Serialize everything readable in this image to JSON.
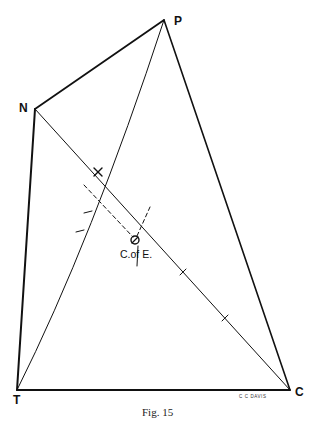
{
  "figure": {
    "caption": "Fig. 15",
    "signature": "C C DAVIS",
    "points": {
      "P": {
        "label": "P",
        "x": 164,
        "y": 20
      },
      "N": {
        "label": "N",
        "x": 35,
        "y": 109
      },
      "T": {
        "label": "T",
        "x": 17,
        "y": 390
      },
      "C": {
        "label": "C",
        "x": 290,
        "y": 390
      }
    },
    "center_label": "C.of E.",
    "cross_mark": "x",
    "line_color": "#111111"
  }
}
